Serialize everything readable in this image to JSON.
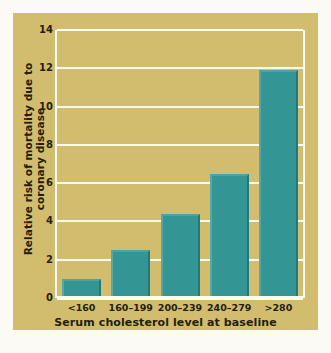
{
  "chart_data": {
    "type": "bar",
    "title": "",
    "xlabel": "Serum cholesterol level at baseline",
    "ylabel": "Relative risk of mortality due to coronary disease",
    "categories": [
      "<160",
      "160–199",
      "200–239",
      "240–279",
      ">280"
    ],
    "values": [
      1.0,
      2.5,
      4.4,
      6.5,
      11.9
    ],
    "ylim": [
      0,
      14
    ],
    "yticks": [
      0,
      2,
      4,
      6,
      8,
      10,
      12,
      14
    ],
    "ytick_labels": [
      "0",
      "2",
      "4",
      "6",
      "8",
      "10",
      "12",
      "14"
    ],
    "grid": true,
    "legend": "none",
    "colors": {
      "bar_fill": "#349595",
      "bar_edge_dark": "#1e7b7d",
      "bar_edge_light": "#59a8a4",
      "panel_background": "#d2bd6e",
      "gridline": "#fdfbf0",
      "text": "#231d0d",
      "page_background": "#fbfaf4"
    }
  }
}
